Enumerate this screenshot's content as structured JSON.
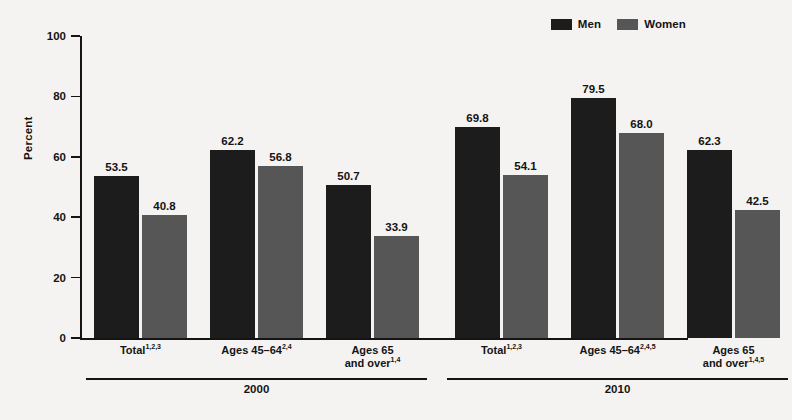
{
  "chart_data": {
    "type": "bar",
    "title": "",
    "xlabel": "",
    "ylabel": "Percent",
    "ylim": [
      0,
      100
    ],
    "yticks": [
      0,
      20,
      40,
      60,
      80,
      100
    ],
    "grid": false,
    "legend_position": "top-right",
    "categories": [
      "Total",
      "Ages 45–64",
      "Ages 65 and over",
      "Total",
      "Ages 45–64",
      "Ages 65 and over"
    ],
    "groups": [
      {
        "label": "2000",
        "categories": [
          {
            "base": "Total",
            "sup": "1,2,3",
            "line1": "Total",
            "line2": ""
          },
          {
            "base": "Ages 45–64",
            "sup": "2,4",
            "line1": "Ages 45–64",
            "line2": ""
          },
          {
            "base": "Ages 65 and over",
            "sup": "1,4",
            "line1": "Ages 65",
            "line2": "and over"
          }
        ]
      },
      {
        "label": "2010",
        "categories": [
          {
            "base": "Total",
            "sup": "1,2,3",
            "line1": "Total",
            "line2": ""
          },
          {
            "base": "Ages 45–64",
            "sup": "2,4,5",
            "line1": "Ages 45–64",
            "line2": ""
          },
          {
            "base": "Ages 65 and over",
            "sup": "1,4,5",
            "line1": "Ages 65",
            "line2": "and over"
          }
        ]
      }
    ],
    "series": [
      {
        "name": "Men",
        "color": "#1c1c1c",
        "values": [
          53.5,
          62.2,
          50.7,
          69.8,
          79.5,
          62.3
        ],
        "labels": [
          "53.5",
          "62.2",
          "50.7",
          "69.8",
          "79.5",
          "62.3"
        ]
      },
      {
        "name": "Women",
        "color": "#565656",
        "values": [
          40.8,
          56.8,
          33.9,
          54.1,
          68.0,
          42.5
        ],
        "labels": [
          "40.8",
          "56.8",
          "33.9",
          "54.1",
          "68.0",
          "42.5"
        ]
      }
    ]
  },
  "legend": {
    "items": [
      {
        "label": "Men",
        "color": "#1c1c1c"
      },
      {
        "label": "Women",
        "color": "#565656"
      }
    ]
  },
  "axis": {
    "y_label": "Percent",
    "y_ticks": [
      "0",
      "20",
      "40",
      "60",
      "80",
      "100"
    ]
  }
}
